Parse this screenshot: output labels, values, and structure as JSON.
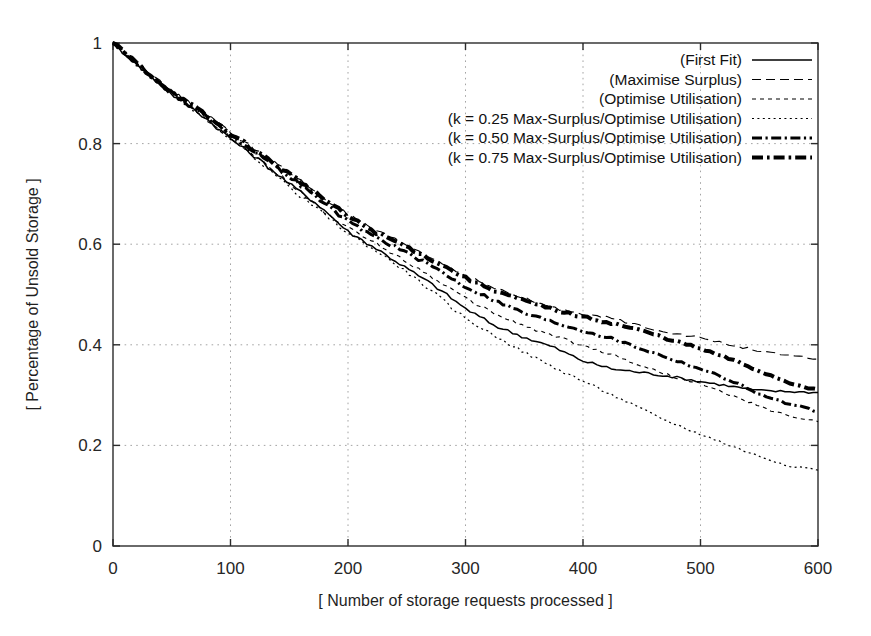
{
  "chart_data": {
    "type": "line",
    "title": "",
    "xlabel": "[ Number of storage requests processed ]",
    "ylabel": "[ Percentage of Unsold Storage ]",
    "xlim": [
      0,
      600
    ],
    "ylim": [
      0,
      1
    ],
    "xticks": [
      "0",
      "100",
      "200",
      "300",
      "400",
      "500",
      "600"
    ],
    "xtick_values": [
      0,
      100,
      200,
      300,
      400,
      500,
      600
    ],
    "yticks": [
      "0",
      "0.2",
      "0.4",
      "0.6",
      "0.8",
      "1"
    ],
    "ytick_values": [
      0,
      0.2,
      0.4,
      0.6,
      0.8,
      1
    ],
    "grid": true,
    "grid_style": "dotted",
    "legend_position": "top-right",
    "x": [
      0,
      25,
      50,
      75,
      100,
      125,
      150,
      175,
      200,
      225,
      250,
      275,
      300,
      325,
      350,
      375,
      400,
      425,
      450,
      475,
      500,
      525,
      550,
      575,
      600
    ],
    "series": [
      {
        "name": "(First Fit)",
        "style": "solid",
        "linewidth": 1.5,
        "color": "#000000",
        "values": [
          1.0,
          0.948,
          0.898,
          0.858,
          0.81,
          0.767,
          0.72,
          0.678,
          0.625,
          0.59,
          0.552,
          0.515,
          0.472,
          0.438,
          0.415,
          0.395,
          0.368,
          0.352,
          0.345,
          0.337,
          0.327,
          0.318,
          0.309,
          0.307,
          0.305
        ]
      },
      {
        "name": "(Maximise Surplus)",
        "style": "dashed",
        "linewidth": 1.1,
        "color": "#000000",
        "values": [
          1.0,
          0.95,
          0.903,
          0.865,
          0.822,
          0.783,
          0.742,
          0.7,
          0.658,
          0.625,
          0.598,
          0.568,
          0.538,
          0.512,
          0.492,
          0.473,
          0.462,
          0.452,
          0.437,
          0.424,
          0.414,
          0.4,
          0.388,
          0.378,
          0.372
        ]
      },
      {
        "name": "(Optimise Utilisation)",
        "style": "dotted-medium",
        "linewidth": 1.1,
        "color": "#000000",
        "values": [
          1.0,
          0.948,
          0.898,
          0.857,
          0.812,
          0.77,
          0.722,
          0.673,
          0.632,
          0.6,
          0.565,
          0.53,
          0.492,
          0.462,
          0.437,
          0.418,
          0.398,
          0.38,
          0.358,
          0.338,
          0.322,
          0.3,
          0.278,
          0.258,
          0.248
        ]
      },
      {
        "name": "(k = 0.25 Max-Surplus/Optimise Utilisation)",
        "style": "dotted-fine",
        "linewidth": 1.2,
        "color": "#000000",
        "values": [
          1.0,
          0.948,
          0.9,
          0.857,
          0.81,
          0.765,
          0.713,
          0.668,
          0.622,
          0.585,
          0.545,
          0.5,
          0.452,
          0.418,
          0.385,
          0.355,
          0.328,
          0.3,
          0.272,
          0.245,
          0.222,
          0.2,
          0.178,
          0.16,
          0.152
        ]
      },
      {
        "name": "(k = 0.50 Max-Surplus/Optimise Utilisation)",
        "style": "dash-dot",
        "linewidth": 3.0,
        "color": "#000000",
        "values": [
          1.0,
          0.95,
          0.9,
          0.862,
          0.818,
          0.777,
          0.735,
          0.69,
          0.645,
          0.612,
          0.583,
          0.552,
          0.515,
          0.488,
          0.463,
          0.445,
          0.428,
          0.412,
          0.392,
          0.372,
          0.352,
          0.33,
          0.302,
          0.282,
          0.268
        ]
      },
      {
        "name": "(k = 0.75 Max-Surplus/Optimise Utilisation)",
        "style": "dash-dot-bold",
        "linewidth": 4.0,
        "color": "#000000",
        "values": [
          1.0,
          0.95,
          0.902,
          0.863,
          0.82,
          0.78,
          0.74,
          0.698,
          0.655,
          0.622,
          0.595,
          0.565,
          0.533,
          0.508,
          0.487,
          0.47,
          0.455,
          0.443,
          0.428,
          0.41,
          0.392,
          0.372,
          0.348,
          0.325,
          0.31
        ]
      }
    ]
  },
  "legend": {
    "entries": [
      {
        "label": "(First Fit)",
        "style": "solid"
      },
      {
        "label": "(Maximise Surplus)",
        "style": "dashed"
      },
      {
        "label": "(Optimise Utilisation)",
        "style": "dotted-medium"
      },
      {
        "label": "(k = 0.25 Max-Surplus/Optimise Utilisation)",
        "style": "dotted-fine"
      },
      {
        "label": "(k = 0.50 Max-Surplus/Optimise Utilisation)",
        "style": "dash-dot"
      },
      {
        "label": "(k = 0.75 Max-Surplus/Optimise Utilisation)",
        "style": "dash-dot-bold"
      }
    ]
  },
  "geometry": {
    "plot_left": 113,
    "plot_right": 818,
    "plot_top": 43,
    "plot_bottom": 546
  }
}
